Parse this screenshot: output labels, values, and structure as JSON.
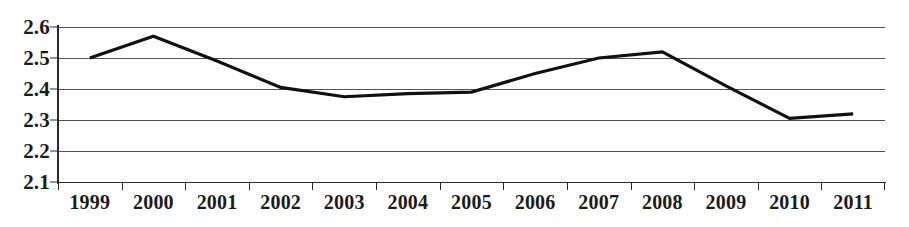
{
  "chart_data": {
    "type": "line",
    "title": "",
    "subtitle": "",
    "xlabel": "",
    "ylabel": "",
    "categories": [
      "1999",
      "2000",
      "2001",
      "2002",
      "2003",
      "2004",
      "2005",
      "2006",
      "2007",
      "2008",
      "2009",
      "2010",
      "2011"
    ],
    "x": [
      1999,
      2000,
      2001,
      2002,
      2003,
      2004,
      2005,
      2006,
      2007,
      2008,
      2009,
      2010,
      2011
    ],
    "values": [
      2.5,
      2.57,
      2.49,
      2.405,
      2.375,
      2.385,
      2.39,
      2.45,
      2.5,
      2.52,
      2.41,
      2.305,
      2.32
    ],
    "series": [
      {
        "name": "",
        "values": [
          2.5,
          2.57,
          2.49,
          2.405,
          2.375,
          2.385,
          2.39,
          2.45,
          2.5,
          2.52,
          2.41,
          2.305,
          2.32
        ]
      }
    ],
    "ylim": [
      2.1,
      2.6
    ],
    "xlim": [
      1999,
      2011
    ],
    "ytick_labels": [
      "2.6",
      "2.5",
      "2.4",
      "2.3",
      "2.2",
      "2.1"
    ],
    "ytick_values": [
      2.6,
      2.5,
      2.4,
      2.3,
      2.2,
      2.1
    ],
    "ytick_step": 0.1,
    "grid": true,
    "grid_axis": "y",
    "legend": false,
    "legend_position": "none",
    "line_color": "#111111",
    "grid_color": "#3c3c3c",
    "axis_color": "#2b2b2b",
    "markers": false,
    "annotations": []
  }
}
